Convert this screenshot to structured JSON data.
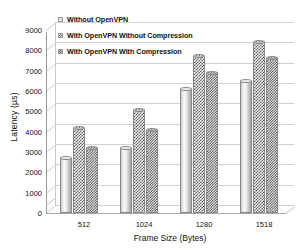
{
  "chart_data": {
    "type": "bar",
    "title": "",
    "xlabel": "Frame Size (Bytes)",
    "ylabel": "Latency (µs)",
    "categories": [
      "512",
      "1024",
      "1280",
      "1518"
    ],
    "series": [
      {
        "name": "Without OpenVPN",
        "values": [
          2700,
          3200,
          6100,
          6500
        ]
      },
      {
        "name": "With OpenVPN Without Compression",
        "values": [
          4200,
          5050,
          7700,
          8400
        ]
      },
      {
        "name": "With OpenVPN With Compression",
        "values": [
          3200,
          4100,
          6900,
          7600
        ]
      }
    ],
    "ylim": [
      0,
      9000
    ],
    "yticks": [
      0,
      1000,
      2000,
      3000,
      4000,
      5000,
      6000,
      7000,
      8000,
      9000
    ],
    "ytick_labels": [
      "0",
      "1000",
      "2000",
      "3000",
      "4000",
      "5000",
      "6000",
      "7000",
      "8000",
      "9000"
    ],
    "grid": true,
    "legend_position": "top-left",
    "style": "3d-cylinder",
    "colors": {
      "series1": "#e2e2e2",
      "series2": "#5e5e5e",
      "series3": "#4a4a4a",
      "gridline": "#d2d2d2",
      "axis": "#9a9a9a",
      "text": "#111111",
      "background": "#ffffff"
    }
  },
  "legend": {
    "items": [
      {
        "label": "Without OpenVPN"
      },
      {
        "label": "With OpenVPN Without Compression"
      },
      {
        "label": "With OpenVPN With Compression"
      }
    ]
  }
}
